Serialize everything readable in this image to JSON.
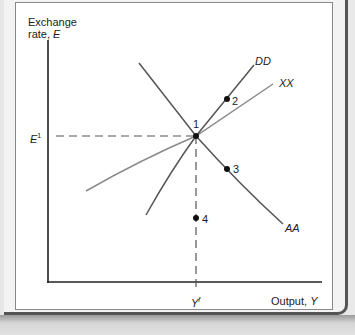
{
  "diagram": {
    "y_axis_label_line1": "Exchange",
    "y_axis_label_line2": "rate,",
    "y_axis_var": "E",
    "x_axis_label": "Output,",
    "x_axis_var": "Y",
    "e_label": "E",
    "e_sup": "1",
    "y_label": "Y",
    "y_sup": "f",
    "curves": {
      "dd": "DD",
      "xx": "XX",
      "aa": "AA"
    },
    "points": {
      "p1": "1",
      "p2": "2",
      "p3": "3",
      "p4": "4"
    },
    "colors": {
      "axis": "#222222",
      "curve_dark": "#555555",
      "curve_light": "#8a8a8a",
      "dashed": "#555555",
      "dot": "#111111"
    }
  }
}
